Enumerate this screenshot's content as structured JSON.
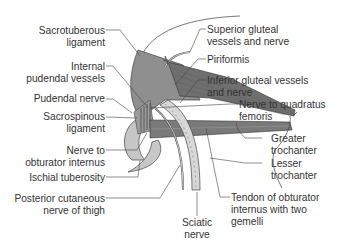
{
  "diagram": {
    "labels_left": [
      {
        "id": "sacrotuberous",
        "line1": "Sacrotuberous",
        "line2": "ligament"
      },
      {
        "id": "internal_pudendal",
        "line1": "Internal",
        "line2": "pudendal vessels"
      },
      {
        "id": "pudendal_nerve",
        "line1": "Pudendal nerve",
        "line2": ""
      },
      {
        "id": "sacrospinous",
        "line1": "Sacrospinous",
        "line2": "ligament"
      },
      {
        "id": "nerve_obturator",
        "line1": "Nerve to",
        "line2": "obturator internus"
      },
      {
        "id": "ischial_tuberosity",
        "line1": "Ischial tuberosity",
        "line2": ""
      },
      {
        "id": "posterior_cutaneous",
        "line1": "Posterior cutaneous",
        "line2": "nerve of thigh"
      }
    ],
    "labels_right": [
      {
        "id": "superior_gluteal",
        "line1": "Superior gluteal",
        "line2": "vessels and nerve"
      },
      {
        "id": "piriformis",
        "line1": "Piriformis",
        "line2": ""
      },
      {
        "id": "inferior_gluteal",
        "line1": "Inferior gluteal vessels",
        "line2": "and nerve"
      },
      {
        "id": "nerve_quadratus",
        "line1": "Nerve to quadratus",
        "line2": "femoris"
      },
      {
        "id": "greater_trochanter",
        "line1": "Greater",
        "line2": "trochanter"
      },
      {
        "id": "lesser_trochanter",
        "line1": "Lesser",
        "line2": "trochanter"
      },
      {
        "id": "tendon_obturator",
        "line1": "Tendon of obturator",
        "line2": "internus with two",
        "line3": "gemelli"
      }
    ],
    "labels_bottom": [
      {
        "id": "sciatic",
        "line1": "Sciatic",
        "line2": "nerve"
      }
    ],
    "colors": {
      "muscle": "#8a8a8a",
      "muscle_dark": "#5e5e5e",
      "ligament": "#9a9a9a",
      "bone": "#c8c8c8",
      "nerve": "#d9d9d9",
      "outline": "#444444",
      "leader": "#444444",
      "text": "#333333"
    }
  }
}
